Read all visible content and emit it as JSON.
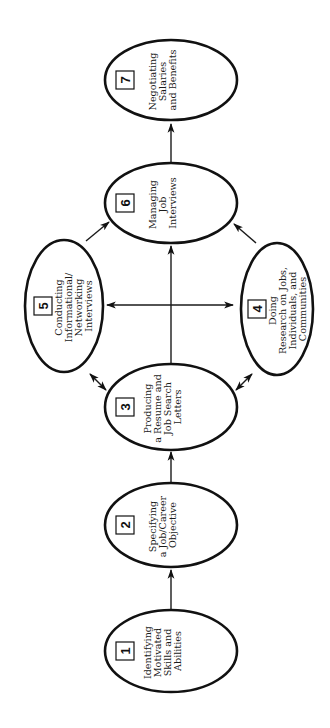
{
  "diagram": {
    "orientation": "rotated 90 degrees counter-clockwise",
    "colors": {
      "stroke": "#111111",
      "background": "#ffffff"
    },
    "steps": [
      {
        "number": "1",
        "lines": [
          "Identifying",
          "Motivated",
          "Skills and",
          "Abilities"
        ]
      },
      {
        "number": "2",
        "lines": [
          "Specifying",
          "a Job/Career",
          "Objective"
        ]
      },
      {
        "number": "3",
        "lines": [
          "Producing",
          "a Resume and",
          "Job Search",
          "Letters"
        ]
      },
      {
        "number": "4",
        "lines": [
          "Doing",
          "Research on Jobs,",
          "Individuals, and",
          "Communities"
        ]
      },
      {
        "number": "5",
        "lines": [
          "Conducting",
          "Informational/",
          "Networking",
          "Interviews"
        ]
      },
      {
        "number": "6",
        "lines": [
          "Managing",
          "Job",
          "Interviews"
        ]
      },
      {
        "number": "7",
        "lines": [
          "Negotiating",
          "Salaries",
          "and Benefits"
        ]
      }
    ],
    "connections": [
      {
        "from": "1",
        "to": "2",
        "type": "arrow"
      },
      {
        "from": "2",
        "to": "3",
        "type": "arrow"
      },
      {
        "from": "3",
        "to": "4",
        "type": "double-arrow"
      },
      {
        "from": "3",
        "to": "5",
        "type": "double-arrow"
      },
      {
        "from": "3",
        "to": "6",
        "type": "arrow"
      },
      {
        "from": "4",
        "to": "6",
        "type": "arrow"
      },
      {
        "from": "5",
        "to": "6",
        "type": "arrow"
      },
      {
        "from": "4",
        "to": "5",
        "type": "double-arrow"
      },
      {
        "from": "6",
        "to": "7",
        "type": "arrow"
      }
    ]
  }
}
